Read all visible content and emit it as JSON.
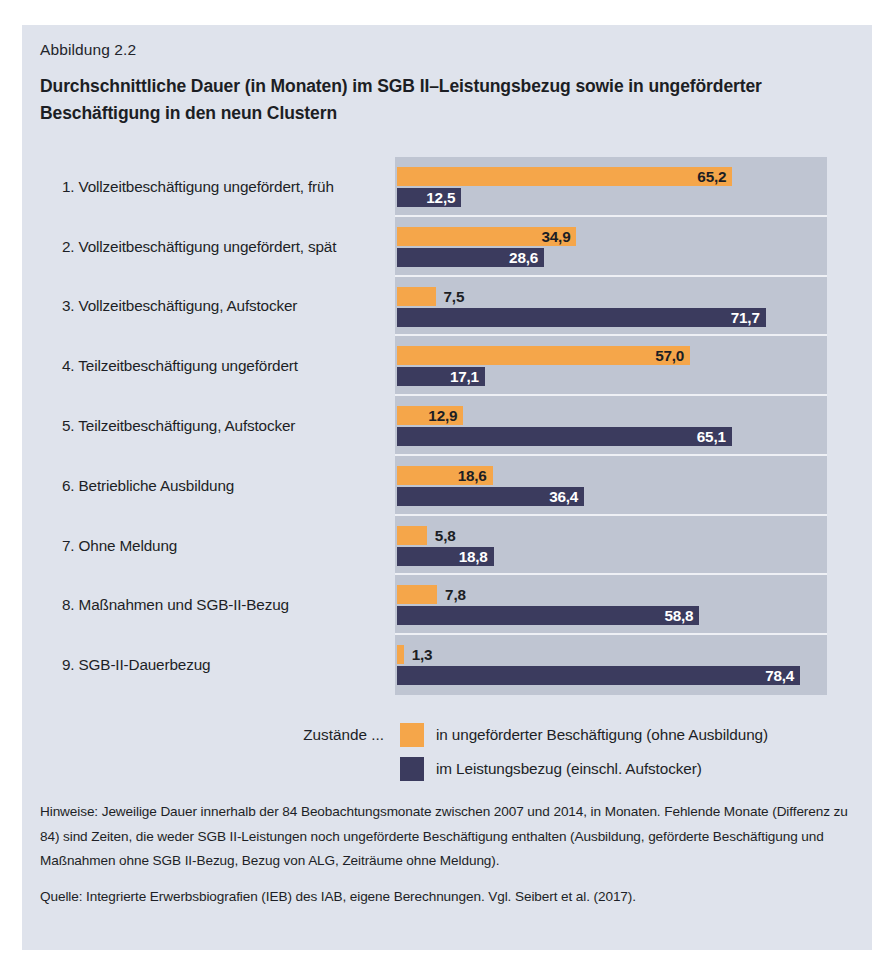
{
  "figure": {
    "number": "Abbildung 2.2",
    "title": "Durchschnittliche Dauer (in Monaten) im SGB II–Leistungsbezug sowie in ungeförderter Beschäftigung in den neun Clustern"
  },
  "legend": {
    "prefix": "Zustände ...",
    "entries": [
      {
        "label": "in ungeförderter Beschäftigung (ohne Ausbildung)",
        "color": "#f5a64a"
      },
      {
        "label": "im Leistungsbezug (einschl. Aufstocker)",
        "color": "#3b3b5e"
      }
    ]
  },
  "notes": [
    "Hinweise: Jeweilige Dauer innerhalb der 84 Beobachtungsmonate zwischen 2007 und 2014, in Monaten. Fehlende Monate (Differenz zu 84) sind Zeiten, die weder SGB II-Leistungen noch ungeförderte Beschäftigung enthalten (Ausbildung, geförderte Beschäftigung und Maßnahmen ohne SGB II-Bezug, Bezug von ALG, Zeiträume ohne Meldung).",
    "Quelle: Integrierte Erwerbsbiografien (IEB) des IAB, eigene Berechnungen. Vgl. Seibert et al. (2017)."
  ],
  "chart_data": {
    "type": "bar",
    "orientation": "horizontal",
    "title": "Durchschnittliche Dauer (in Monaten) im SGB II–Leistungsbezug sowie in ungeförderter Beschäftigung in den neun Clustern",
    "xlabel": "",
    "ylabel": "",
    "xlim": [
      0,
      84
    ],
    "grid": false,
    "legend_position": "bottom",
    "categories": [
      "1. Vollzeitbeschäftigung ungefördert, früh",
      "2. Vollzeitbeschäftigung ungefördert, spät",
      "3. Vollzeitbeschäftigung, Aufstocker",
      "4. Teilzeitbeschäftigung ungefördert",
      "5. Teilzeitbeschäftigung, Aufstocker",
      "6. Betriebliche Ausbildung",
      "7. Ohne Meldung",
      "8. Maßnahmen und SGB-II-Bezug",
      "9. SGB-II-Dauerbezug"
    ],
    "series": [
      {
        "name": "in ungeförderter Beschäftigung (ohne Ausbildung)",
        "color": "#f5a64a",
        "values": [
          65.2,
          34.9,
          7.5,
          57.0,
          12.9,
          18.6,
          5.8,
          7.8,
          1.3
        ],
        "labels": [
          "65,2",
          "34,9",
          "7,5",
          "57,0",
          "12,9",
          "18,6",
          "5,8",
          "7,8",
          "1,3"
        ]
      },
      {
        "name": "im Leistungsbezug (einschl. Aufstocker)",
        "color": "#3b3b5e",
        "values": [
          12.5,
          28.6,
          71.7,
          17.1,
          65.1,
          36.4,
          18.8,
          58.8,
          78.4
        ],
        "labels": [
          "12,5",
          "28,6",
          "71,7",
          "17,1",
          "65,1",
          "36,4",
          "18,8",
          "58,8",
          "78,4"
        ]
      }
    ]
  }
}
